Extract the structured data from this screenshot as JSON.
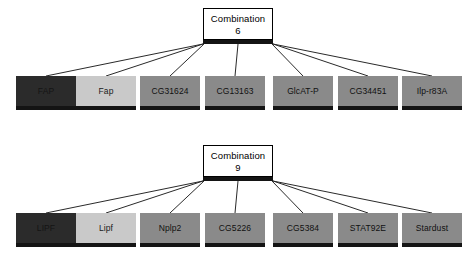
{
  "figure": {
    "background_color": "#ffffff",
    "width": 470,
    "height": 263
  },
  "palette": {
    "dark_node_fill": "#2b2b2b",
    "dark_node_text": "#141414",
    "light_node_fill": "#c9c9c9",
    "light_node_text": "#1a1a1a",
    "medium_node_fill": "#8a8a8a",
    "medium_node_text": "#111111",
    "node_shadow": "#141414",
    "combo_bar": "#141414",
    "combo_box_fill": "#ffffff",
    "combo_box_border": "#000000",
    "edge_color": "#2a2a2a"
  },
  "groups": [
    {
      "id": "combination-6",
      "combination": {
        "label": "Combination",
        "number": "6"
      },
      "nodes": [
        {
          "label": "FAP",
          "style": "dark"
        },
        {
          "label": "Fap",
          "style": "light"
        },
        {
          "label": "CG31624",
          "style": "medium"
        },
        {
          "label": "CG13163",
          "style": "medium"
        },
        {
          "label": "GlcAT-P",
          "style": "medium"
        },
        {
          "label": "CG34451",
          "style": "medium"
        },
        {
          "label": "Ilp-r83A",
          "style": "medium"
        }
      ]
    },
    {
      "id": "combination-9",
      "combination": {
        "label": "Combination",
        "number": "9"
      },
      "nodes": [
        {
          "label": "LIPF",
          "style": "dark"
        },
        {
          "label": "Lipf",
          "style": "light"
        },
        {
          "label": "Nplp2",
          "style": "medium"
        },
        {
          "label": "CG5226",
          "style": "medium"
        },
        {
          "label": "CG5384",
          "style": "medium"
        },
        {
          "label": "STAT92E",
          "style": "medium"
        },
        {
          "label": "Stardust",
          "style": "medium"
        }
      ]
    }
  ],
  "layout": {
    "node_width": 60,
    "node_height": 34,
    "node_lefts": [
      16,
      76,
      140,
      205,
      273,
      338,
      402
    ],
    "group_tops": [
      8,
      145
    ],
    "combo_box": {
      "left": 203,
      "width": 70,
      "height": 32
    },
    "combo_bar": {
      "left": 203,
      "width": 70,
      "height": 4
    },
    "node_top_offset": 68
  }
}
